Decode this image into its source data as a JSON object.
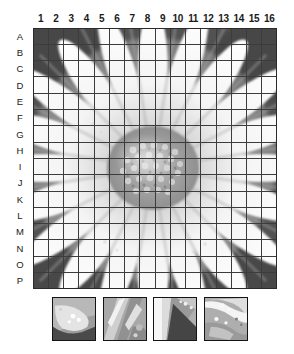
{
  "grid": {
    "columns": [
      "1",
      "2",
      "3",
      "4",
      "5",
      "6",
      "7",
      "8",
      "9",
      "10",
      "11",
      "12",
      "13",
      "14",
      "15",
      "16"
    ],
    "rows": [
      "A",
      "B",
      "C",
      "D",
      "E",
      "F",
      "G",
      "H",
      "I",
      "J",
      "K",
      "L",
      "M",
      "N",
      "O",
      "P"
    ],
    "column_count": 16,
    "row_count": 16,
    "line_color": "#3c3c3c",
    "border_color": "#2b2b2b"
  },
  "image": {
    "subject": "daisy-flower-grayscale-photo",
    "background_color": "#4d4d4d",
    "petal_color": "#fafafa",
    "petal_shadow_color": "#c8c8c8",
    "center_disc_color": "#9a9a9a",
    "center_disc_highlight": "#e6e6e6"
  },
  "thumbnails": [
    {
      "name": "detail-crop-1",
      "caption": "petal-tip-over-dark-background"
    },
    {
      "name": "detail-crop-2",
      "caption": "diagonal-petal-streaks"
    },
    {
      "name": "detail-crop-3",
      "caption": "bright-petal-edge-dark-wedge"
    },
    {
      "name": "detail-crop-4",
      "caption": "petal-surface-speckles"
    }
  ]
}
